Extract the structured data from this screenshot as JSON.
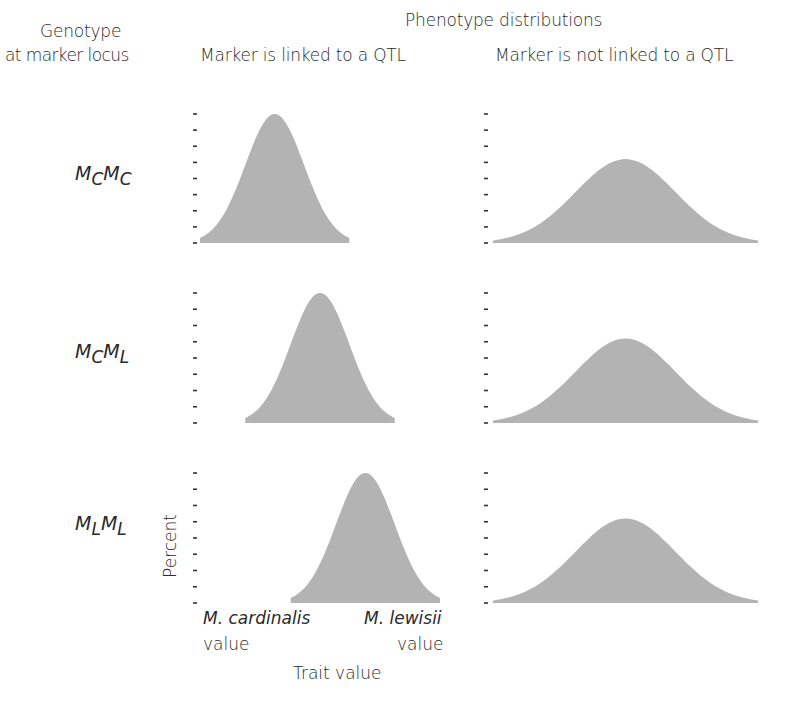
{
  "header": {
    "row_column_title_line1": "Genotype",
    "row_column_title_line2": "at marker locus",
    "super_title": "Phenotype distributions",
    "col_left_title": "Marker is linked to a QTL",
    "col_right_title": "Marker is not linked to a QTL"
  },
  "genotypes": [
    {
      "base1": "M",
      "sub1": "C",
      "base2": "M",
      "sub2": "C"
    },
    {
      "base1": "M",
      "sub1": "C",
      "base2": "M",
      "sub2": "L"
    },
    {
      "base1": "M",
      "sub1": "L",
      "base2": "M",
      "sub2": "L"
    }
  ],
  "axes": {
    "ylabel": "Percent",
    "xlabel": "Trait value",
    "x_left_label_line1": "M. cardinalis",
    "x_left_label_line2": "value",
    "x_right_label_line1": "M. lewisii",
    "x_right_label_line2": "value"
  },
  "colors": {
    "fill": "#b3b3b3",
    "tick": "#333333",
    "text": "#2a2a2a"
  },
  "chart_data": {
    "type": "area",
    "title": "Phenotype distributions",
    "xlabel": "Trait value",
    "ylabel": "Percent",
    "x_range_labels": [
      "M. cardinalis value",
      "M. lewisii value"
    ],
    "ytick_count": 9,
    "grid": false,
    "columns": [
      "Marker is linked to a QTL",
      "Marker is not linked to a QTL"
    ],
    "rows": [
      "MCMC",
      "MCML",
      "MLML"
    ],
    "panels": [
      {
        "row": "MCMC",
        "column": "Marker is linked to a QTL",
        "mean": 0.28,
        "sd": 0.11,
        "relative_peak": 1.0,
        "x_extent": [
          0.0,
          0.56
        ]
      },
      {
        "row": "MCMC",
        "column": "Marker is not linked to a QTL",
        "mean": 0.45,
        "sd": 0.17,
        "relative_peak": 0.65,
        "x_extent": [
          0.0,
          0.9
        ]
      },
      {
        "row": "MCML",
        "column": "Marker is linked to a QTL",
        "mean": 0.45,
        "sd": 0.11,
        "relative_peak": 1.0,
        "x_extent": [
          0.17,
          0.73
        ]
      },
      {
        "row": "MCML",
        "column": "Marker is not linked to a QTL",
        "mean": 0.45,
        "sd": 0.17,
        "relative_peak": 0.65,
        "x_extent": [
          0.0,
          0.9
        ]
      },
      {
        "row": "MLML",
        "column": "Marker is linked to a QTL",
        "mean": 0.62,
        "sd": 0.11,
        "relative_peak": 1.0,
        "x_extent": [
          0.34,
          0.9
        ]
      },
      {
        "row": "MLML",
        "column": "Marker is not linked to a QTL",
        "mean": 0.45,
        "sd": 0.17,
        "relative_peak": 0.65,
        "x_extent": [
          0.0,
          0.9
        ]
      }
    ]
  }
}
